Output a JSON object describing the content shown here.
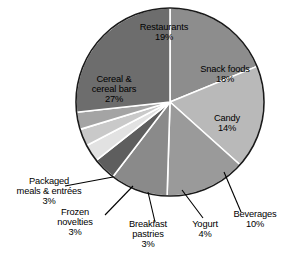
{
  "chart_data": {
    "type": "pie",
    "title": "",
    "subtitle": "",
    "xlabel": "",
    "ylabel": "",
    "legend_position": "none",
    "grid": false,
    "units": "percent",
    "start_angle_deg": 0,
    "direction": "clockwise",
    "total_percent": 101,
    "categories": [
      "Restaurants",
      "Snack foods",
      "Candy",
      "Beverages",
      "Yogurt",
      "Breakfast pastries",
      "Frozen novelties",
      "Packaged meals & entrées",
      "Cereal & cereal bars"
    ],
    "values": [
      19,
      18,
      14,
      10,
      4,
      3,
      3,
      3,
      27
    ],
    "colors": [
      "#8d8d8d",
      "#b9b9b9",
      "#9a9a9a",
      "#8a8a8a",
      "#5e5e5e",
      "#e2e2e2",
      "#c9c9c9",
      "#a4a4a4",
      "#6d6d6d"
    ],
    "slices": [
      {
        "label": "Restaurants",
        "value": 19,
        "value_text": "19%",
        "color": "#8d8d8d",
        "label_placement": "inside"
      },
      {
        "label": "Snack foods",
        "value": 18,
        "value_text": "18%",
        "color": "#b9b9b9",
        "label_placement": "inside"
      },
      {
        "label": "Candy",
        "value": 14,
        "value_text": "14%",
        "color": "#9a9a9a",
        "label_placement": "inside"
      },
      {
        "label": "Beverages",
        "value": 10,
        "value_text": "10%",
        "color": "#8a8a8a",
        "label_placement": "outside"
      },
      {
        "label": "Yogurt",
        "value": 4,
        "value_text": "4%",
        "color": "#5e5e5e",
        "label_placement": "outside"
      },
      {
        "label": "Breakfast pastries",
        "value": 3,
        "value_text": "3%",
        "color": "#e2e2e2",
        "label_placement": "outside"
      },
      {
        "label": "Frozen novelties",
        "value": 3,
        "value_text": "3%",
        "color": "#c9c9c9",
        "label_placement": "outside"
      },
      {
        "label": "Packaged meals & entrées",
        "value": 3,
        "value_text": "3%",
        "color": "#a4a4a4",
        "label_placement": "outside"
      },
      {
        "label": "Cereal & cereal bars",
        "value": 27,
        "value_text": "27%",
        "color": "#6d6d6d",
        "label_placement": "inside"
      }
    ]
  },
  "labels": {
    "restaurants": {
      "name": "Restaurants",
      "pct": "19%"
    },
    "snack_foods": {
      "line1": "Snack foods",
      "pct": "18%"
    },
    "candy": {
      "name": "Candy",
      "pct": "14%"
    },
    "cereal": {
      "line1": "Cereal &",
      "line2": "cereal bars",
      "pct": "27%"
    },
    "packaged": {
      "line1": "Packaged",
      "line2": "meals & entrées",
      "pct": "3%"
    },
    "frozen": {
      "line1": "Frozen",
      "line2": "novelties",
      "pct": "3%"
    },
    "breakfast": {
      "line1": "Breakfast",
      "line2": "pastries",
      "pct": "3%"
    },
    "yogurt": {
      "name": "Yogurt",
      "pct": "4%"
    },
    "beverages": {
      "name": "Beverages",
      "pct": "10%"
    }
  },
  "style": {
    "outline_color": "#1a1a1a",
    "separator_color": "#ffffff",
    "leader_color": "#000000",
    "background": "#ffffff"
  }
}
